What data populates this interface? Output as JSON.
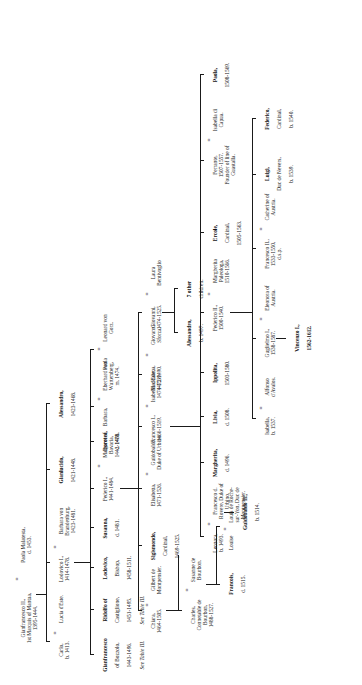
{
  "document": {
    "kind": "genealogical-table",
    "family": "Gonzaga",
    "orientation": "rotated-90-ccw",
    "page_background": "#ffffff",
    "ink_color": "#1a1a1a"
  },
  "generations": [
    {
      "index": 1,
      "label": "generation-1",
      "nodes": [
        {
          "id": "gianfrancesco-ii",
          "name": "Gianfrancesco II.,",
          "title": "1st Marquis of Mantua,",
          "dates": "1395-1444.",
          "spouse_marker": "=",
          "spouse_name": "Paola Malatesta,",
          "spouse_dates": "d. 1453."
        }
      ]
    },
    {
      "index": 2,
      "label": "generation-2",
      "nodes": [
        {
          "id": "carlo",
          "name": "Carlo,",
          "dates": "b. 1413.",
          "spouse_marker": "=",
          "spouse_name": "Lucia d'Este."
        },
        {
          "id": "lodovico-i",
          "name": "Lodovico I.,",
          "dates": "1414-1478.",
          "spouse_marker": "=",
          "spouse_name": "Barbara von Brandenburg,",
          "spouse_dates": "1423-1481."
        },
        {
          "id": "gianlucido",
          "name": "Gianlucido,",
          "dates": "1421-1448."
        },
        {
          "id": "alessandro-1",
          "name": "Alessandro,",
          "dates": "1423-1468."
        }
      ]
    },
    {
      "index": 3,
      "label": "generation-3",
      "nodes": [
        {
          "id": "gianfrancesco-bozzolo",
          "name": "Gianfrancesco",
          "title": "of Bozzolo,",
          "dates": "1443-1496.",
          "reference": "See Table III."
        },
        {
          "id": "ridolfo-castiglione",
          "name": "Ridolfo of",
          "title": "Castiglione,",
          "dates": "1451-1495.",
          "reference": "See Table III."
        },
        {
          "id": "lodovico-bishop",
          "name": "Lodovico,",
          "title": "Bishop,",
          "dates": "1458-1511."
        },
        {
          "id": "susanna",
          "name": "Susanna,",
          "dates": "d. 1481."
        },
        {
          "id": "federico-i",
          "name": "Federico I.,",
          "dates": "1441-1484.",
          "spouse_marker": "=",
          "spouse_name": "Margaret of Bavaria,",
          "spouse_dates": "1442-1478."
        },
        {
          "id": "dorotea",
          "name": "Dorotea,",
          "dates": "d. 1468."
        },
        {
          "id": "barbara",
          "name": "Barbara,",
          "spouse_marker": "=",
          "spouse_name": "Eberhard von Wurtemberg,",
          "spouse_dates": "m. 1474."
        },
        {
          "id": "paola",
          "name": "Paola",
          "spouse_marker": "=",
          "spouse_name": "Leonard von Gorz."
        }
      ]
    },
    {
      "index": 4,
      "label": "generation-4",
      "nodes": [
        {
          "id": "chiara",
          "name": "Chiara,",
          "dates": "1464-1505.",
          "spouse_marker": "=",
          "spouse_name": "Gilbert de Montpensier."
        },
        {
          "id": "sigismondo-cardinal",
          "name": "Sigismondo,",
          "title": "Cardinal,",
          "dates": "1469-1525."
        },
        {
          "id": "elisabetta",
          "name": "Elisabetta,",
          "dates": "1471-1526.",
          "spouse_marker": "=",
          "spouse_name": "Guidobaldo, Duke of Urbino."
        },
        {
          "id": "francesco-i",
          "name": "Francesco I.,",
          "dates": "1466-1519.",
          "spouse_marker": "=",
          "spouse_name": "Isabella d'Este,",
          "spouse_dates": "1474-1539."
        },
        {
          "id": "maddalena",
          "name": "Maddalena,",
          "dates": "1472-1490.",
          "spouse_marker": "=",
          "spouse_name": "Giovanni Sforza."
        },
        {
          "id": "giovanni",
          "name": "Giovanni,",
          "dates": "1474-1525.",
          "spouse_marker": "=",
          "spouse_name": "Laura Bentivoglio"
        }
      ]
    },
    {
      "index": 5,
      "label": "generation-5",
      "nodes": [
        {
          "id": "charles-bourbon",
          "name": "Charles,",
          "title": "Connetable de Bourbon,",
          "dates": "1488-1527.",
          "spouse_marker": "=",
          "spouse_name": "Susanne de Bourbon."
        },
        {
          "id": "francois",
          "name": "Francois,",
          "dates": "d. 1515."
        },
        {
          "id": "louise",
          "name": "Louise",
          "spouse_marker": "=",
          "spouse_name": "Louis de Roche-sur-Yon, Duc de Montpensier."
        },
        {
          "id": "leonora",
          "name": "Leonora,",
          "dates": "b. 1493.",
          "spouse_marker": "=",
          "spouse_name": "Francesco d. Rovere, Duke of Urbino."
        },
        {
          "id": "margherita",
          "name": "Margherita,",
          "dates": "d. 1496."
        },
        {
          "id": "livia",
          "name": "Livia,",
          "dates": "d. 1508."
        },
        {
          "id": "ippolita",
          "name": "Ippolita,",
          "dates": "1503-1580."
        },
        {
          "id": "federico-ii",
          "name": "Federico II.,",
          "dates": "1500-1540.",
          "spouse_marker": "=",
          "spouse_name": "Margherita Paleologa,",
          "spouse_dates": "1510-1566."
        },
        {
          "id": "ercole-cardinal",
          "name": "Ercole,",
          "title": "Cardinal,",
          "dates": "1505-1563."
        },
        {
          "id": "ferrante",
          "name": "Ferrante,",
          "dates": "1507-1557.",
          "title": "Founder of line of Guastalla.",
          "spouse_marker": "=",
          "spouse_name": "Isabella di Capua."
        },
        {
          "id": "paola-2",
          "name": "Paola,",
          "dates": "1508-1569."
        },
        {
          "id": "alessandro-b1497",
          "name": "Alessandro,",
          "dates": "b. 1497."
        },
        {
          "id": "seven-other-children",
          "name": "7 other",
          "title": "children."
        }
      ]
    },
    {
      "index": 6,
      "label": "generation-6",
      "nodes": [
        {
          "id": "guidobaldo-ii",
          "name": "Guidobaldo II.,",
          "dates": "b. 1514."
        },
        {
          "id": "isabella-b1537",
          "name": "Isabella,",
          "dates": "b. 1537.",
          "spouse_marker": "=",
          "spouse_name": "Alfonso d'Avalos."
        },
        {
          "id": "guglielmo-i",
          "name": "Guglielmo I.,",
          "dates": "1538-1587.",
          "spouse_marker": "=",
          "spouse_name": "Eleonora of Austria."
        },
        {
          "id": "francesco-iii",
          "name": "Francesco II.,",
          "dates": "1533-1550,",
          "note": "d.s.p.",
          "spouse_marker": "=",
          "spouse_name": "Catherine of Austria."
        },
        {
          "id": "luigi-nevers",
          "name": "Luigi,",
          "title": "Duc de Nevers,",
          "dates": "b. 1539."
        },
        {
          "id": "federico-cardinal",
          "name": "Federico,",
          "title": "Cardinal,",
          "dates": "b. 1540."
        }
      ]
    },
    {
      "index": 7,
      "label": "generation-7",
      "nodes": [
        {
          "id": "vincenzo-i",
          "name": "Vincenzo I.,",
          "dates": "1562-1612."
        }
      ]
    }
  ],
  "symbols": {
    "marriage": "=",
    "see_table": "See Table III."
  }
}
